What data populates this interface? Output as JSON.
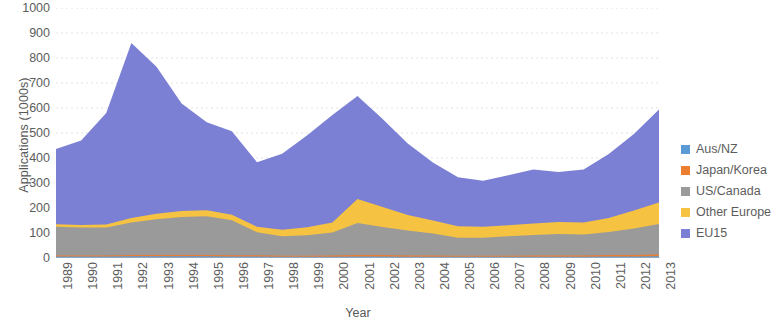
{
  "chart_data": {
    "type": "area",
    "stacked": true,
    "title": "",
    "xlabel": "Year",
    "ylabel": "Applications (1000s)",
    "ylim": [
      0,
      1000
    ],
    "ytick_step": 100,
    "yticks": [
      0,
      100,
      200,
      300,
      400,
      500,
      600,
      700,
      800,
      900,
      1000
    ],
    "grid": true,
    "grid_axis": "y",
    "legend_position": "right",
    "categories": [
      "1989",
      "1990",
      "1991",
      "1992",
      "1993",
      "1994",
      "1995",
      "1996",
      "1997",
      "1998",
      "1999",
      "2000",
      "2001",
      "2002",
      "2003",
      "2004",
      "2005",
      "2006",
      "2007",
      "2008",
      "2009",
      "2010",
      "2011",
      "2012",
      "2013"
    ],
    "x": [
      1989,
      1990,
      1991,
      1992,
      1993,
      1994,
      1995,
      1996,
      1997,
      1998,
      1999,
      2000,
      2001,
      2002,
      2003,
      2004,
      2005,
      2006,
      2007,
      2008,
      2009,
      2010,
      2011,
      2012,
      2013
    ],
    "series": [
      {
        "name": "Aus/NZ",
        "color": "#5b9bd5",
        "values": [
          6,
          6,
          6,
          7,
          7,
          7,
          7,
          6,
          6,
          5,
          5,
          5,
          6,
          6,
          5,
          5,
          5,
          5,
          5,
          5,
          5,
          5,
          6,
          6,
          7
        ]
      },
      {
        "name": "Japan/Korea",
        "color": "#ed7d31",
        "values": [
          4,
          4,
          4,
          5,
          5,
          5,
          5,
          5,
          5,
          4,
          4,
          5,
          6,
          6,
          5,
          5,
          4,
          4,
          4,
          5,
          5,
          5,
          6,
          6,
          7
        ]
      },
      {
        "name": "US/Canada",
        "color": "#9a9a9a",
        "values": [
          115,
          112,
          112,
          130,
          143,
          152,
          155,
          140,
          92,
          78,
          82,
          92,
          128,
          112,
          100,
          88,
          72,
          72,
          78,
          82,
          86,
          84,
          92,
          106,
          122
        ]
      },
      {
        "name": "Other Europe",
        "color": "#f5c242",
        "values": [
          10,
          10,
          12,
          18,
          22,
          24,
          24,
          22,
          22,
          26,
          32,
          40,
          96,
          80,
          62,
          52,
          46,
          44,
          44,
          46,
          48,
          48,
          56,
          72,
          86
        ]
      },
      {
        "name": "EU15",
        "color": "#7b80d4",
        "values": [
          301,
          338,
          446,
          700,
          588,
          430,
          352,
          334,
          258,
          304,
          368,
          430,
          412,
          352,
          286,
          232,
          196,
          184,
          200,
          216,
          200,
          212,
          256,
          306,
          372
        ]
      }
    ],
    "series_totals": [
      436,
      470,
      580,
      860,
      765,
      618,
      543,
      507,
      383,
      417,
      491,
      572,
      648,
      556,
      458,
      382,
      323,
      309,
      331,
      354,
      344,
      354,
      416,
      496,
      594
    ],
    "notes": {
      "peak_year": "1992",
      "peak_total": 860,
      "min_year": "2006",
      "min_total": 309
    }
  },
  "legend": {
    "items": [
      {
        "label": "Aus/NZ",
        "color": "#5b9bd5"
      },
      {
        "label": "Japan/Korea",
        "color": "#ed7d31"
      },
      {
        "label": "US/Canada",
        "color": "#9a9a9a"
      },
      {
        "label": "Other Europe",
        "color": "#f5c242"
      },
      {
        "label": "EU15",
        "color": "#7b80d4"
      }
    ]
  },
  "axes": {
    "y_title": "Applications (1000s)",
    "x_title": "Year"
  }
}
